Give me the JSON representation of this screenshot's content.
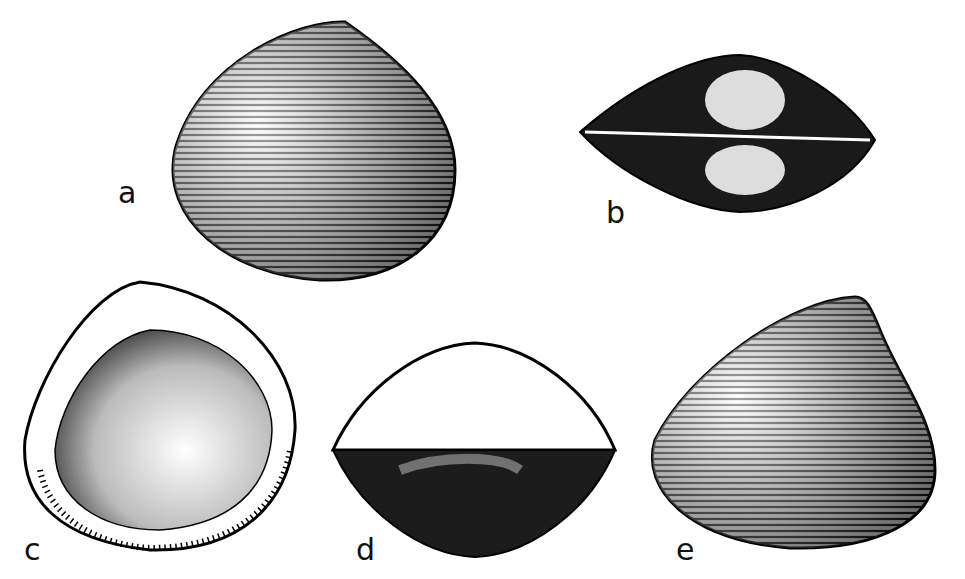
{
  "figure": {
    "panels": [
      {
        "label": "a",
        "view": "exterior valve"
      },
      {
        "label": "b",
        "view": "dorsal view of closed valves"
      },
      {
        "label": "c",
        "view": "interior of valve"
      },
      {
        "label": "d",
        "view": "ventral/end view"
      },
      {
        "label": "e",
        "view": "exterior valve, oblique"
      }
    ]
  }
}
